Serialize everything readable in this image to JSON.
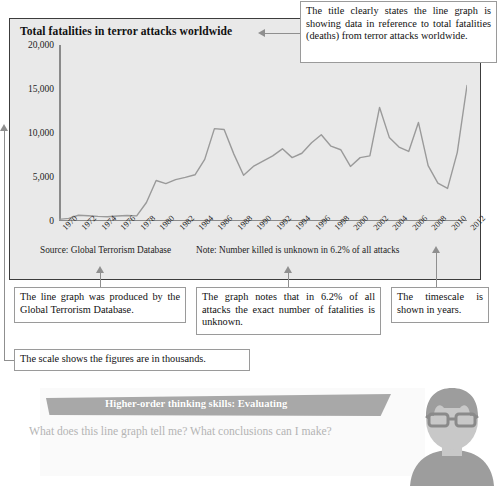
{
  "chart": {
    "title": "Total fatalities in terror attacks worldwide",
    "footnote_source": "Source: Global Terrorism Database",
    "footnote_note": "Note: Number killed is unknown in 6.2% of all attacks"
  },
  "chart_data": {
    "type": "line",
    "title": "Total fatalities in terror attacks worldwide",
    "xlabel": "",
    "ylabel": "",
    "ylim": [
      0,
      20000
    ],
    "xlim": [
      1970,
      2012
    ],
    "grid": false,
    "legend": "none",
    "ytick_labels": [
      "0",
      "5,000",
      "10,000",
      "15,000",
      "20,000"
    ],
    "ytick_values": [
      0,
      5000,
      10000,
      15000,
      20000
    ],
    "xtick_labels": [
      "1970",
      "1972",
      "1974",
      "1976",
      "1978",
      "1980",
      "1982",
      "1984",
      "1986",
      "1988",
      "1990",
      "1992",
      "1994",
      "1996",
      "1998",
      "2000",
      "2002",
      "2004",
      "2006",
      "2008",
      "2010",
      "2012"
    ],
    "x": [
      1970,
      1971,
      1972,
      1973,
      1974,
      1975,
      1976,
      1977,
      1978,
      1979,
      1980,
      1981,
      1982,
      1983,
      1984,
      1985,
      1986,
      1987,
      1988,
      1989,
      1990,
      1991,
      1992,
      1993,
      1994,
      1995,
      1996,
      1997,
      1998,
      1999,
      2000,
      2001,
      2002,
      2003,
      2004,
      2005,
      2006,
      2007,
      2008,
      2009,
      2010,
      2011,
      2012
    ],
    "values": [
      180,
      300,
      650,
      600,
      520,
      480,
      560,
      620,
      580,
      2100,
      4600,
      4250,
      4700,
      4950,
      5250,
      7000,
      10500,
      10400,
      7600,
      5200,
      6200,
      6800,
      7400,
      8200,
      7200,
      7700,
      8900,
      9800,
      8500,
      8100,
      6200,
      7200,
      7400,
      12900,
      9500,
      8400,
      7900,
      11200,
      6300,
      4300,
      3700,
      7800,
      15400
    ],
    "series_color": "#9a9a9a"
  },
  "callouts": {
    "title_callout": "The title clearly states the line graph is showing data in reference to total fatalities (deaths) from terror attacks worldwide.",
    "source_callout": "The line graph was produced by the Global Terrorism Database.",
    "note_callout": "The graph notes that in 6.2% of all attacks the exact number of fatalities is unknown.",
    "timescale_callout": "The timescale is shown in years.",
    "scale_callout": "The scale shows the figures are in thousands."
  },
  "hots": {
    "banner_label": "Higher-order thinking skills: Evaluating",
    "question": "What does this line graph tell me? What conclusions can I make?"
  },
  "footer": {
    "text": ""
  },
  "colors": {
    "panel_background": "#e9e9e9",
    "panel_border": "#3c3c3c",
    "line": "#9a9a9a",
    "banner": "#a8a8a8",
    "callout_border": "#9a9a9a",
    "avatar": "#bfbfbf"
  }
}
